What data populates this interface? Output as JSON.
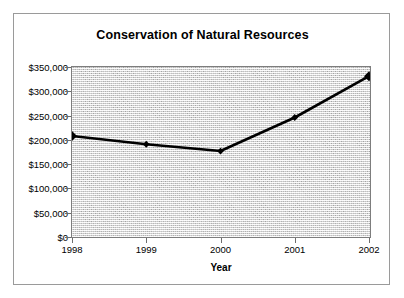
{
  "chart_data": {
    "type": "line",
    "title": "Conservation of Natural Resources",
    "xlabel": "Year",
    "ylabel": "",
    "categories": [
      "1998",
      "1999",
      "2000",
      "2001",
      "2002"
    ],
    "values": [
      208000,
      191000,
      177000,
      246000,
      331000
    ],
    "series": [
      {
        "name": "Conservation of Natural Resources",
        "values": [
          208000,
          191000,
          177000,
          246000,
          331000
        ]
      }
    ],
    "ylim": [
      0,
      350000
    ],
    "yticks": [
      0,
      50000,
      100000,
      150000,
      200000,
      250000,
      300000,
      350000
    ],
    "ytick_labels": [
      "$0",
      "$50,000",
      "$100,000",
      "$150,000",
      "$200,000",
      "$250,000",
      "$300,000",
      "$350,000"
    ],
    "xtick_labels": [
      "1998",
      "1999",
      "2000",
      "2001",
      "2002"
    ],
    "grid": false,
    "legend": "none",
    "marker": "diamond",
    "line_color": "#000000",
    "marker_color": "#000000",
    "plot_background": "#dcdcdc",
    "frame_border_color": "#9a9a9a",
    "annotations": []
  }
}
